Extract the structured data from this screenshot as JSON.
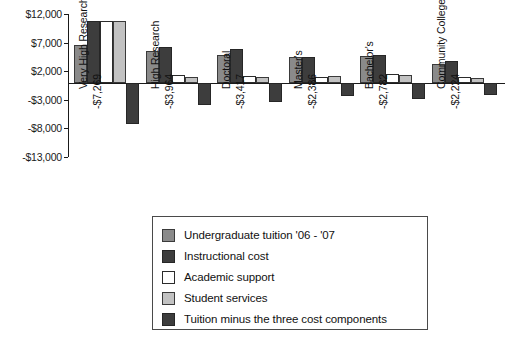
{
  "chart_data": {
    "type": "bar",
    "title": "",
    "xlabel": "",
    "ylabel": "",
    "ylim": [
      -13000,
      12000
    ],
    "grid": false,
    "legend_position": "bottom-center",
    "yticks": [
      "$12,000",
      "$7,000",
      "$2,000",
      "-$3,000",
      "-$8,000",
      "-$13,000"
    ],
    "ytick_values": [
      12000,
      7000,
      2000,
      -3000,
      -8000,
      -13000
    ],
    "categories": [
      "Very High Research",
      "High Research",
      "Doctoral",
      "Master's",
      "Bachelor's",
      "Community College"
    ],
    "annotations": [
      "-$7,269",
      "-$3,964",
      "-$3,417",
      "-$2,386",
      "-$2,782",
      "-$2,224"
    ],
    "series": [
      {
        "name": "Undergraduate tuition '06 - '07",
        "color": "#8a8a8a",
        "values": [
          6500,
          5600,
          4900,
          4500,
          4700,
          3200
        ]
      },
      {
        "name": "Instructional cost",
        "color": "#3d3d3d",
        "values": [
          10800,
          6200,
          5900,
          4400,
          4900,
          3700
        ]
      },
      {
        "name": "Academic support",
        "color": "#ffffff",
        "values": [
          10800,
          1300,
          1200,
          1000,
          1500,
          900
        ]
      },
      {
        "name": "Student services",
        "color": "#c2c2c2",
        "values": [
          10800,
          1000,
          900,
          1100,
          1400,
          800
        ]
      },
      {
        "name": "Tuition minus the three cost components",
        "color": "#3d3d3d",
        "values": [
          -7269,
          -3964,
          -3417,
          -2386,
          -2782,
          -2224
        ]
      }
    ]
  },
  "legend": {
    "items": [
      {
        "label": "Undergraduate tuition '06 - '07",
        "swatch": "#8a8a8a",
        "border": "#3a3a3a"
      },
      {
        "label": "Instructional cost",
        "swatch": "#3d3d3d",
        "border": "#262626"
      },
      {
        "label": "Academic support",
        "swatch": "#ffffff",
        "border": "#2b2b2b"
      },
      {
        "label": "Student services",
        "swatch": "#c2c2c2",
        "border": "#3a3a3a"
      },
      {
        "label": "Tuition minus the three cost components",
        "swatch": "#3d3d3d",
        "border": "#262626"
      }
    ]
  }
}
